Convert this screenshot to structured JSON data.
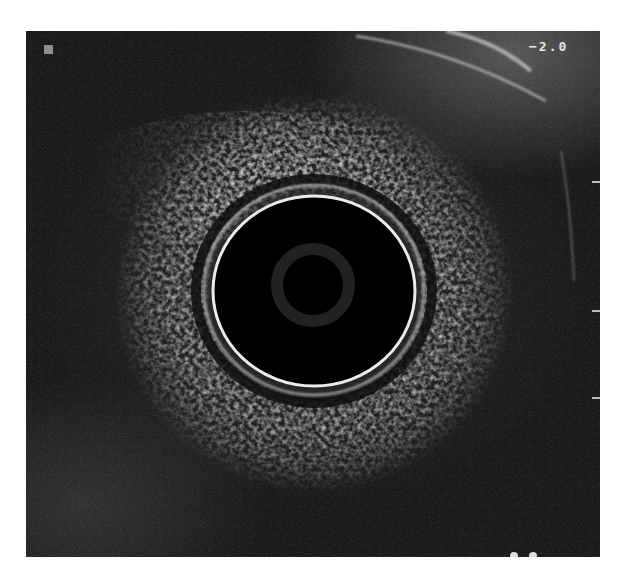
{
  "image": {
    "type": "endoscopic ultrasound radial scan",
    "scale_label": "−2.0",
    "marker": "gray-square",
    "colors": {
      "background": "#ffffff",
      "tissue_dark": "#1c1c1c",
      "lumen": "#000000",
      "balloon_ring": "#e8e8e8",
      "label_text": "#e6e6e6",
      "marker": "#8f8f8f"
    }
  }
}
